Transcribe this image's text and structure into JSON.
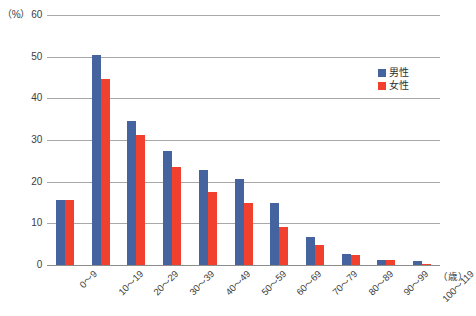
{
  "chart_data": {
    "type": "bar",
    "title": "",
    "subtitle": "",
    "xlabel": "（歳）",
    "ylabel": "（%）",
    "unit_label": "（%）",
    "xaxis_unit": "（歳）",
    "grid": true,
    "legend_position": "top-right",
    "ylim": [
      0,
      60
    ],
    "yticks": [
      0,
      10,
      20,
      30,
      40,
      50,
      60
    ],
    "ytick_labels": [
      "0",
      "10",
      "20",
      "30",
      "40",
      "50",
      "60"
    ],
    "categories": [
      "0〜9",
      "10〜19",
      "20〜29",
      "30〜39",
      "40〜49",
      "50〜59",
      "60〜69",
      "70〜79",
      "80〜89",
      "90〜99",
      "100〜119"
    ],
    "series": [
      {
        "name": "男性",
        "color": "#44639f",
        "values": [
          15.6,
          50.5,
          34.6,
          27.3,
          22.7,
          20.7,
          15.0,
          6.8,
          2.7,
          1.2,
          1.0
        ]
      },
      {
        "name": "女性",
        "color": "#f1402e",
        "values": [
          15.6,
          44.6,
          31.2,
          23.5,
          17.6,
          14.9,
          9.1,
          4.9,
          2.3,
          1.1,
          0.2
        ]
      }
    ]
  },
  "legend": {
    "items": [
      {
        "label": "男性",
        "color": "#44639f"
      },
      {
        "label": "女性",
        "color": "#f1402e"
      }
    ]
  },
  "colors": {
    "male": "#44639f",
    "female": "#f1402e",
    "gridline": "#a8a8a8",
    "text": "#3d3d3d",
    "background": "#ffffff"
  }
}
